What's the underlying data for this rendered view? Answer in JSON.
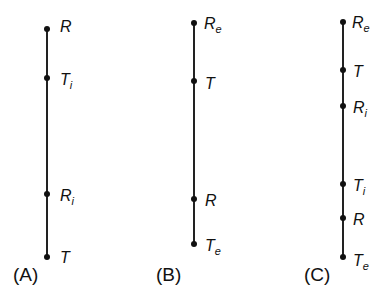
{
  "panels": [
    {
      "id": "A",
      "label": "(A)",
      "points": [
        {
          "base": "R",
          "sub": ""
        },
        {
          "base": "T",
          "sub": "i"
        },
        {
          "base": "R",
          "sub": "i"
        },
        {
          "base": "T",
          "sub": ""
        }
      ]
    },
    {
      "id": "B",
      "label": "(B)",
      "points": [
        {
          "base": "R",
          "sub": "e"
        },
        {
          "base": "T",
          "sub": ""
        },
        {
          "base": "R",
          "sub": ""
        },
        {
          "base": "T",
          "sub": "e"
        }
      ]
    },
    {
      "id": "C",
      "label": "(C)",
      "points": [
        {
          "base": "R",
          "sub": "e"
        },
        {
          "base": "T",
          "sub": ""
        },
        {
          "base": "R",
          "sub": "i"
        },
        {
          "base": "T",
          "sub": "i"
        },
        {
          "base": "R",
          "sub": ""
        },
        {
          "base": "T",
          "sub": "e"
        }
      ]
    }
  ]
}
